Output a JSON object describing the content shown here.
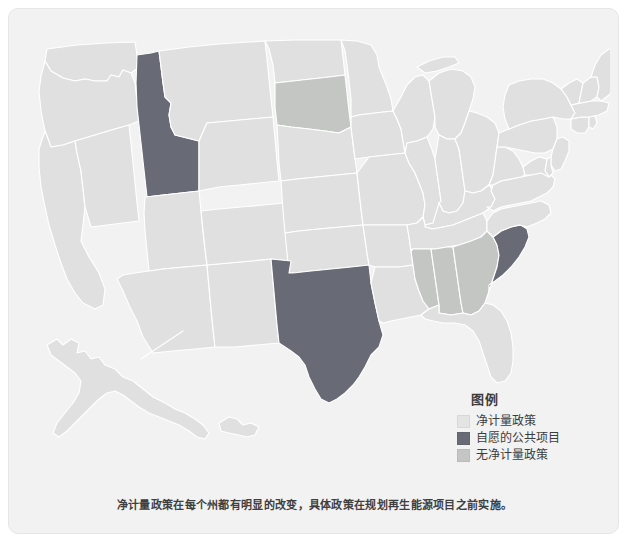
{
  "card": {
    "background_color": "#f2f2f2",
    "border_color": "#e6e6e6"
  },
  "map": {
    "title": "",
    "base_state_color": "#e0e0e0",
    "border_color": "#ffffff",
    "categories": [
      {
        "key": "net_metering",
        "label": "净计量政策",
        "color": "#e0e0e0"
      },
      {
        "key": "voluntary_utility_program",
        "label": "自愿的公共项目",
        "color": "#686a75"
      },
      {
        "key": "no_net_metering",
        "label": "无净计量政策",
        "color": "#c4c6c4"
      }
    ],
    "states": [
      {
        "code": "ID",
        "name": "Idaho",
        "category": "voluntary_utility_program"
      },
      {
        "code": "TX",
        "name": "Texas",
        "category": "voluntary_utility_program"
      },
      {
        "code": "SC",
        "name": "South Carolina",
        "category": "voluntary_utility_program"
      },
      {
        "code": "SD",
        "name": "South Dakota",
        "category": "no_net_metering"
      },
      {
        "code": "MS",
        "name": "Mississippi",
        "category": "no_net_metering"
      },
      {
        "code": "AL",
        "name": "Alabama",
        "category": "no_net_metering"
      },
      {
        "code": "GA",
        "name": "Georgia",
        "category": "no_net_metering"
      }
    ]
  },
  "legend": {
    "title": "图例",
    "items": [
      {
        "label": "净计量政策",
        "color": "#e4e4e4"
      },
      {
        "label": "自愿的公共项目",
        "color": "#686a75"
      },
      {
        "label": "无净计量政策",
        "color": "#c4c6c4"
      }
    ]
  },
  "caption": {
    "text": "净计量政策在每个州都有明显的改变，具体政策在规划再生能源项目之前实施。"
  }
}
